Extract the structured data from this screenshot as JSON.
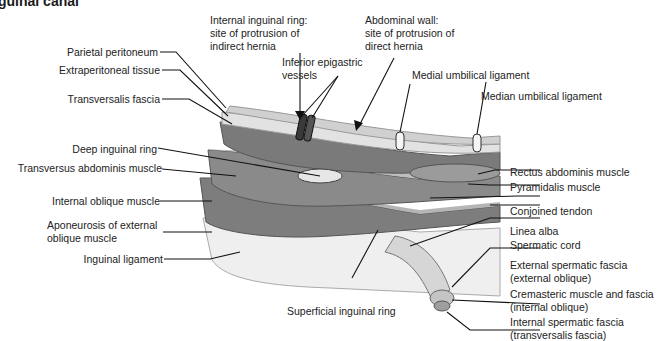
{
  "title": "guinal canal",
  "labels": {
    "parietal_peritoneum": "Parietal peritoneum",
    "extraperitoneal_tissue": "Extraperitoneal tissue",
    "transversalis_fascia": "Transversalis fascia",
    "deep_inguinal_ring": "Deep inguinal ring",
    "transversus_abdominis": "Transversus abdominis muscle",
    "internal_oblique": "Internal oblique muscle",
    "aponeurosis_line1": "Aponeurosis of external",
    "aponeurosis_line2": "oblique muscle",
    "inguinal_ligament": "Inguinal ligament",
    "internal_ring_line1": "Internal inguinal ring:",
    "internal_ring_line2": "site of protrusion of",
    "internal_ring_line3": "indirect hernia",
    "abdominal_wall_line1": "Abdominal wall:",
    "abdominal_wall_line2": "site of protrusion of",
    "abdominal_wall_line3": "direct hernia",
    "inferior_epigastric_line1": "Inferior epigastric",
    "inferior_epigastric_line2": "vessels",
    "medial_umbilical": "Medial umbilical ligament",
    "median_umbilical": "Median umbilical ligament",
    "rectus_abdominis": "Rectus abdominis muscle",
    "pyramidalis": "Pyramidalis muscle",
    "conjoined_tendon": "Conjoined tendon",
    "linea_alba": "Linea alba",
    "spermatic_cord": "Spermatic cord",
    "external_spermatic_line1": "External spermatic fascia",
    "external_spermatic_line2": "(external oblique)",
    "cremasteric_line1": "Cremasteric muscle and fascia",
    "cremasteric_line2": "(internal oblique)",
    "internal_spermatic_line1": "Internal spermatic fascia",
    "internal_spermatic_line2": "(transversalis fascia)",
    "superficial_ring": "Superficial inguinal ring"
  },
  "colors": {
    "layer_light": "#d9d9d9",
    "layer_mid": "#9a9a9a",
    "layer_dark": "#6e6e6e",
    "aponeurosis": "#ececec",
    "leader": "#111111"
  }
}
